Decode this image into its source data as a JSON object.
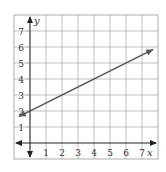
{
  "chart_data": {
    "type": "line",
    "title": "",
    "xlabel": "x",
    "ylabel": "y",
    "xlim": [
      -1,
      8
    ],
    "ylim": [
      -1,
      8
    ],
    "grid": true,
    "x_ticks": [
      "1",
      "2",
      "3",
      "4",
      "5",
      "6",
      "7"
    ],
    "y_ticks": [
      "1",
      "2",
      "3",
      "4",
      "5",
      "6",
      "7"
    ],
    "series": [
      {
        "name": "line",
        "equation": "y = 0.5x + 2",
        "slope": 0.5,
        "intercept": 2,
        "x": [
          -0.7,
          7.7
        ],
        "y": [
          1.65,
          5.85
        ],
        "arrows": "both",
        "color": "#555555"
      }
    ]
  }
}
